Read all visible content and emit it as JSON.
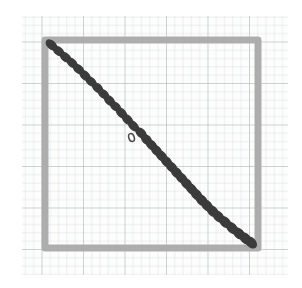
{
  "scene": {
    "title": "Hand-drawn diagram on graph paper",
    "description": "A gray square outline drawn on faint blue-gray graph paper, with a diagonal chain of dark capsule shapes running from the top-left corner of the square to the bottom-right corner. One link near the middle of the chain is drawn hollow (outline only).",
    "canvas": {
      "width": 302,
      "height": 288,
      "background": "#ffffff"
    }
  },
  "paper": {
    "name": "graph-paper",
    "x": 22,
    "y": 16,
    "width": 266,
    "height": 259,
    "fill": "#fdfdfc",
    "grid": {
      "minor_spacing": 8.3,
      "minor_color": "#b9c2cd",
      "minor_width": 0.6,
      "major_spacing": 41.5,
      "major_color": "#97a3b2",
      "major_width": 0.9,
      "visible": true
    }
  },
  "square": {
    "name": "gray-square-outline",
    "x": 45,
    "y": 40,
    "width": 213,
    "height": 208,
    "stroke": "#adadad",
    "stroke_width": 7,
    "fill": "none",
    "corners": {
      "top_left": [
        45,
        40
      ],
      "top_right": [
        258,
        40
      ],
      "bottom_right": [
        258,
        248
      ],
      "bottom_left": [
        45,
        248
      ]
    }
  },
  "chain": {
    "name": "diagonal-capsule-chain",
    "start": [
      50,
      45
    ],
    "end": [
      253,
      243
    ],
    "fill_color": "#3b3b3b",
    "outline_color": "#4a4a4a",
    "link_count": 34,
    "links": [
      {
        "cx": 51.5,
        "cy": 45.0,
        "rx": 6.2,
        "ry": 3.7,
        "rot": 42,
        "filled": true
      },
      {
        "cx": 58.5,
        "cy": 51.0,
        "rx": 6.0,
        "ry": 3.6,
        "rot": 40,
        "filled": true
      },
      {
        "cx": 65.5,
        "cy": 57.2,
        "rx": 6.1,
        "ry": 3.6,
        "rot": 40,
        "filled": true
      },
      {
        "cx": 72.0,
        "cy": 62.8,
        "rx": 5.9,
        "ry": 3.5,
        "rot": 42,
        "filled": true
      },
      {
        "cx": 78.5,
        "cy": 69.0,
        "rx": 6.0,
        "ry": 3.6,
        "rot": 40,
        "filled": true
      },
      {
        "cx": 85.0,
        "cy": 75.5,
        "rx": 6.0,
        "ry": 3.6,
        "rot": 42,
        "filled": true
      },
      {
        "cx": 91.0,
        "cy": 81.5,
        "rx": 5.8,
        "ry": 3.5,
        "rot": 40,
        "filled": true
      },
      {
        "cx": 97.5,
        "cy": 87.8,
        "rx": 6.0,
        "ry": 3.6,
        "rot": 42,
        "filled": true
      },
      {
        "cx": 103.5,
        "cy": 94.0,
        "rx": 5.9,
        "ry": 3.5,
        "rot": 40,
        "filled": true
      },
      {
        "cx": 109.5,
        "cy": 100.5,
        "rx": 6.0,
        "ry": 3.6,
        "rot": 43,
        "filled": true
      },
      {
        "cx": 115.5,
        "cy": 106.5,
        "rx": 5.9,
        "ry": 3.5,
        "rot": 40,
        "filled": true
      },
      {
        "cx": 121.5,
        "cy": 113.0,
        "rx": 6.0,
        "ry": 3.6,
        "rot": 43,
        "filled": true
      },
      {
        "cx": 127.5,
        "cy": 119.5,
        "rx": 6.0,
        "ry": 3.6,
        "rot": 42,
        "filled": true
      },
      {
        "cx": 133.5,
        "cy": 126.0,
        "rx": 6.0,
        "ry": 3.6,
        "rot": 44,
        "filled": true
      },
      {
        "cx": 131.5,
        "cy": 137.5,
        "rx": 4.1,
        "ry": 2.7,
        "rot": 72,
        "filled": false
      },
      {
        "cx": 141.0,
        "cy": 133.0,
        "rx": 6.1,
        "ry": 3.7,
        "rot": 44,
        "filled": true
      },
      {
        "cx": 146.5,
        "cy": 139.5,
        "rx": 6.0,
        "ry": 3.8,
        "rot": 46,
        "filled": true
      },
      {
        "cx": 151.5,
        "cy": 145.0,
        "rx": 6.0,
        "ry": 3.8,
        "rot": 44,
        "filled": true
      },
      {
        "cx": 156.5,
        "cy": 150.5,
        "rx": 6.1,
        "ry": 3.8,
        "rot": 46,
        "filled": true
      },
      {
        "cx": 161.5,
        "cy": 156.0,
        "rx": 6.1,
        "ry": 3.9,
        "rot": 44,
        "filled": true
      },
      {
        "cx": 166.5,
        "cy": 161.5,
        "rx": 6.2,
        "ry": 3.9,
        "rot": 46,
        "filled": true
      },
      {
        "cx": 171.5,
        "cy": 167.0,
        "rx": 6.2,
        "ry": 3.9,
        "rot": 45,
        "filled": true
      },
      {
        "cx": 176.5,
        "cy": 172.5,
        "rx": 6.3,
        "ry": 4.0,
        "rot": 47,
        "filled": true
      },
      {
        "cx": 181.5,
        "cy": 178.0,
        "rx": 6.3,
        "ry": 4.0,
        "rot": 45,
        "filled": true
      },
      {
        "cx": 186.5,
        "cy": 183.5,
        "rx": 6.3,
        "ry": 4.0,
        "rot": 47,
        "filled": true
      },
      {
        "cx": 191.5,
        "cy": 189.0,
        "rx": 6.4,
        "ry": 4.0,
        "rot": 45,
        "filled": true
      },
      {
        "cx": 196.5,
        "cy": 194.5,
        "rx": 6.4,
        "ry": 4.1,
        "rot": 47,
        "filled": true
      },
      {
        "cx": 201.5,
        "cy": 200.0,
        "rx": 6.4,
        "ry": 4.1,
        "rot": 45,
        "filled": true
      },
      {
        "cx": 207.0,
        "cy": 205.5,
        "rx": 6.4,
        "ry": 4.1,
        "rot": 47,
        "filled": true
      },
      {
        "cx": 212.5,
        "cy": 211.0,
        "rx": 6.4,
        "ry": 4.1,
        "rot": 45,
        "filled": true
      },
      {
        "cx": 218.5,
        "cy": 216.5,
        "rx": 6.4,
        "ry": 4.1,
        "rot": 47,
        "filled": true
      },
      {
        "cx": 225.0,
        "cy": 222.0,
        "rx": 6.4,
        "ry": 4.1,
        "rot": 45,
        "filled": true
      },
      {
        "cx": 232.0,
        "cy": 228.0,
        "rx": 6.5,
        "ry": 4.2,
        "rot": 47,
        "filled": true
      },
      {
        "cx": 239.0,
        "cy": 233.5,
        "rx": 6.5,
        "ry": 4.2,
        "rot": 45,
        "filled": true
      },
      {
        "cx": 245.5,
        "cy": 238.5,
        "rx": 6.5,
        "ry": 4.2,
        "rot": 48,
        "filled": true
      },
      {
        "cx": 251.0,
        "cy": 242.5,
        "rx": 6.3,
        "ry": 4.1,
        "rot": 45,
        "filled": true
      }
    ]
  }
}
